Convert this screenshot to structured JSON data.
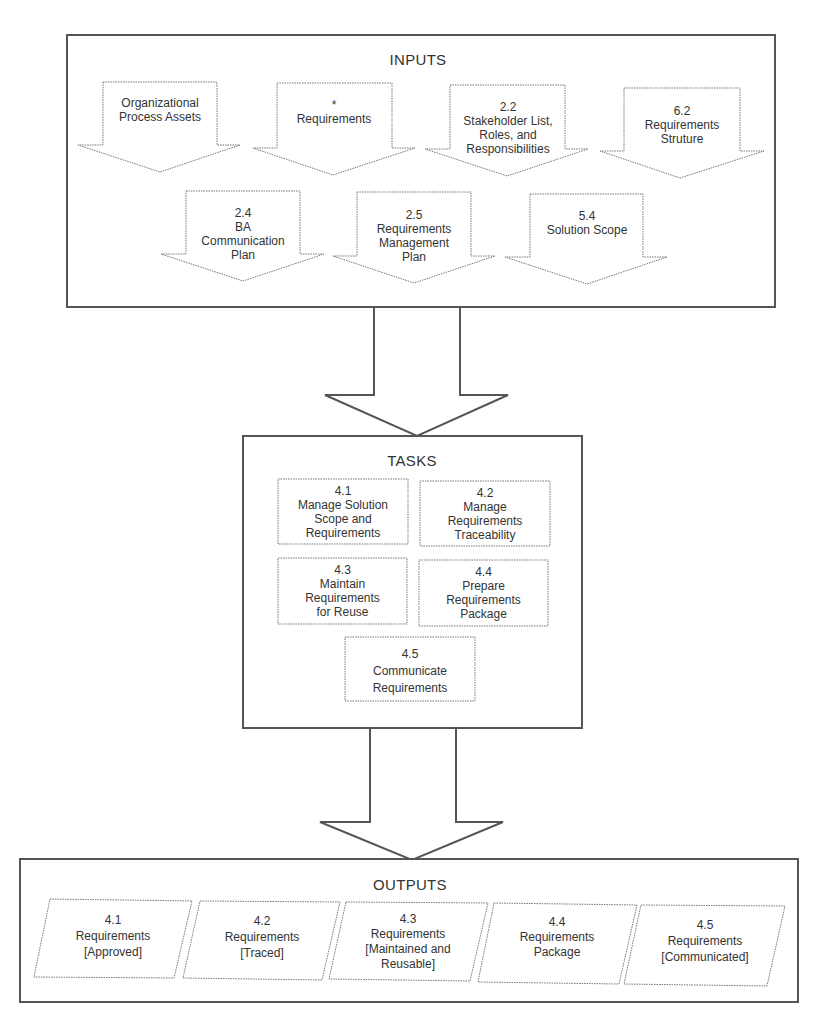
{
  "inputs": {
    "title": "INPUTS",
    "items": [
      {
        "line1": "Organizational",
        "line2": "Process Assets"
      },
      {
        "line1": "*",
        "line2": "Requirements"
      },
      {
        "line1": "2.2",
        "line2": "Stakeholder List,",
        "line3": "Roles, and",
        "line4": "Responsibilities"
      },
      {
        "line1": "6.2",
        "line2": "Requirements",
        "line3": "Struture"
      },
      {
        "line1": "2.4",
        "line2": "BA",
        "line3": "Communication",
        "line4": "Plan"
      },
      {
        "line1": "2.5",
        "line2": "Requirements",
        "line3": "Management",
        "line4": "Plan"
      },
      {
        "line1": "5.4",
        "line2": "Solution Scope"
      }
    ]
  },
  "tasks": {
    "title": "TASKS",
    "items": [
      {
        "line1": "4.1",
        "line2": "Manage Solution",
        "line3": "Scope and",
        "line4": "Requirements"
      },
      {
        "line1": "4.2",
        "line2": "Manage",
        "line3": "Requirements",
        "line4": "Traceability"
      },
      {
        "line1": "4.3",
        "line2": "Maintain",
        "line3": "Requirements",
        "line4": "for Reuse"
      },
      {
        "line1": "4.4",
        "line2": "Prepare",
        "line3": "Requirements",
        "line4": "Package"
      },
      {
        "line1": "4.5",
        "line2": "Communicate",
        "line3": "Requirements"
      }
    ]
  },
  "outputs": {
    "title": "OUTPUTS",
    "items": [
      {
        "line1": "4.1",
        "line2": "Requirements",
        "line3": "[Approved]"
      },
      {
        "line1": "4.2",
        "line2": "Requirements",
        "line3": "[Traced]"
      },
      {
        "line1": "4.3",
        "line2": "Requirements",
        "line3": "[Maintained and",
        "line4": "Reusable]"
      },
      {
        "line1": "4.4",
        "line2": "Requirements",
        "line3": "Package"
      },
      {
        "line1": "4.5",
        "line2": "Requirements",
        "line3": "[Communicated]"
      }
    ]
  },
  "colors": {
    "stroke": "#555555",
    "text": "#333333",
    "background": "#ffffff"
  }
}
